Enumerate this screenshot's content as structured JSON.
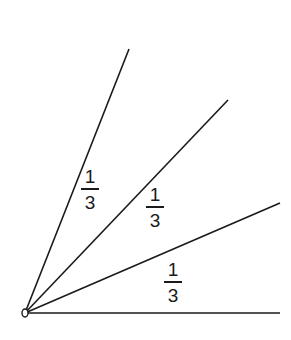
{
  "diagram": {
    "vertex": {
      "x": 25,
      "y": 313,
      "label": ""
    },
    "rays": [
      {
        "name": "ray-top",
        "x2": 129,
        "y2": 49
      },
      {
        "name": "ray-second",
        "x2": 228,
        "y2": 100
      },
      {
        "name": "ray-third",
        "x2": 280,
        "y2": 203
      },
      {
        "name": "ray-horizontal",
        "x2": 280,
        "y2": 313
      }
    ],
    "labels": [
      {
        "name": "fraction-label-1",
        "numerator": "1",
        "denominator": "3",
        "x": 81,
        "y": 167
      },
      {
        "name": "fraction-label-2",
        "numerator": "1",
        "denominator": "3",
        "x": 146,
        "y": 185
      },
      {
        "name": "fraction-label-3",
        "numerator": "1",
        "denominator": "3",
        "x": 164,
        "y": 260
      }
    ],
    "stroke_color": "#1a1a1a"
  }
}
